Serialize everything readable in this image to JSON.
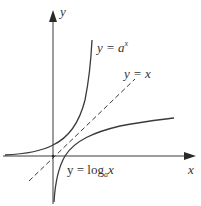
{
  "diagram": {
    "type": "function-graph",
    "axes": {
      "x_label": "x",
      "y_label": "y"
    },
    "curves": [
      {
        "id": "exponential",
        "label_prefix": "y = ",
        "label_base": "a",
        "label_exp": "x",
        "style": "solid"
      },
      {
        "id": "identity",
        "label_prefix": "y = ",
        "label_var": "x",
        "style": "dashed"
      },
      {
        "id": "logarithm",
        "label_prefix": "y = log",
        "label_sub": "a",
        "label_var": "x",
        "style": "solid"
      }
    ],
    "colors": {
      "stroke": "#3a3a3a",
      "text": "#333333",
      "background": "#ffffff"
    }
  }
}
